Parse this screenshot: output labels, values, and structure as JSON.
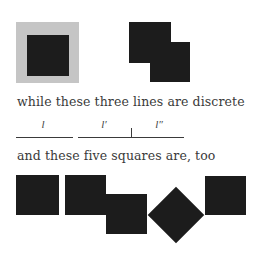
{
  "figure": {
    "caption_lines": [
      "while these three lines are discrete",
      "and these five squares are, too"
    ],
    "line_labels": [
      "l",
      "l′",
      "l″"
    ],
    "colors": {
      "square_fill": "#1c1c1c",
      "frame_gray": "#c5c5c5",
      "text": "#3a3a3a",
      "background": "#ffffff"
    },
    "top_row": {
      "left_shape": "black square inside gray square",
      "right_shape": "two overlapping black squares offset diagonally"
    },
    "bottom_row": {
      "shapes": [
        "square",
        "square",
        "square (lowered)",
        "diamond (rotated square)",
        "square"
      ]
    }
  }
}
